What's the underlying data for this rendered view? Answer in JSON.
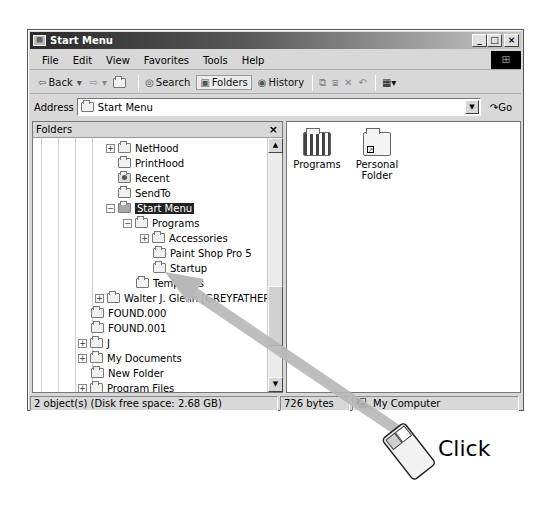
{
  "window": {
    "title": "Start Menu",
    "controls": [
      "_",
      "□",
      "×"
    ]
  },
  "menubar": [
    "File",
    "Edit",
    "View",
    "Favorites",
    "Tools",
    "Help"
  ],
  "toolbar": {
    "back": "Back",
    "search": "Search",
    "folders": "Folders",
    "history": "History"
  },
  "address": {
    "label": "Address",
    "value": "Start Menu",
    "go": "Go"
  },
  "folders_panel": {
    "title": "Folders",
    "close": "×",
    "tree": [
      {
        "label": "NetHood",
        "expander": "+"
      },
      {
        "label": "PrintHood",
        "expander": ""
      },
      {
        "label": "Recent",
        "expander": ""
      },
      {
        "label": "SendTo",
        "expander": ""
      },
      {
        "label": "Start Menu",
        "expander": "−",
        "selected": true
      },
      {
        "label": "Programs",
        "expander": "−"
      },
      {
        "label": "Accessories",
        "expander": "+"
      },
      {
        "label": "Paint Shop Pro 5",
        "expander": ""
      },
      {
        "label": "Startup",
        "expander": ""
      },
      {
        "label": "Templates",
        "expander": ""
      },
      {
        "label": "Walter J. Glenn [GREYFATHER]",
        "expander": "+"
      },
      {
        "label": "FOUND.000",
        "expander": ""
      },
      {
        "label": "FOUND.001",
        "expander": ""
      },
      {
        "label": "J",
        "expander": "+"
      },
      {
        "label": "My Documents",
        "expander": "+"
      },
      {
        "label": "New Folder",
        "expander": ""
      },
      {
        "label": "Program Files",
        "expander": "+"
      }
    ]
  },
  "content": {
    "items": [
      {
        "label": "Programs"
      },
      {
        "label": "Personal Folder"
      }
    ]
  },
  "statusbar": {
    "objects": "2 object(s) (Disk free space: 2.68 GB)",
    "size": "726 bytes",
    "zone": "My Computer"
  },
  "annotation": {
    "label": "Click",
    "arrow_color": "#b8b8b8"
  }
}
